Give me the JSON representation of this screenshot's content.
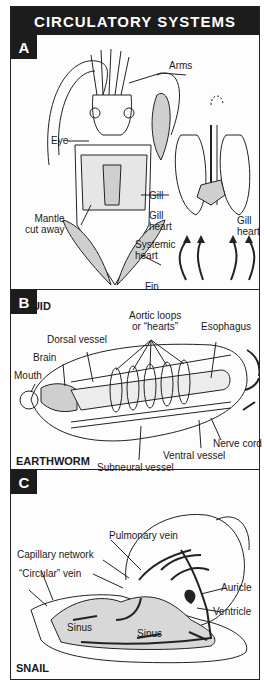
{
  "title": "CIRCULATORY SYSTEMS",
  "panels": [
    {
      "letter": "A",
      "organism": "SQUID",
      "labels": {
        "arms": "Arms",
        "eye": "Eye",
        "gill_left": "Gill",
        "gill_heart_left_1": "Gill",
        "gill_heart_left_2": "heart",
        "gill_heart_right_1": "Gill",
        "gill_heart_right_2": "heart",
        "mantle_1": "Mantle",
        "mantle_2": "cut away",
        "systemic_1": "Systemic",
        "systemic_2": "heart",
        "fin": "Fin"
      }
    },
    {
      "letter": "B",
      "organism": "EARTHWORM",
      "labels": {
        "aortic_1": "Aortic loops",
        "aortic_2": "or “hearts”",
        "esophagus": "Esophagus",
        "dorsal": "Dorsal vessel",
        "brain": "Brain",
        "mouth": "Mouth",
        "nerve": "Nerve cord",
        "ventral": "Ventral vessel",
        "subneural": "Subneural vessel"
      }
    },
    {
      "letter": "C",
      "organism": "SNAIL",
      "labels": {
        "pulmonary": "Pulmonary vein",
        "capillary": "Capillary network",
        "circular": "“Circular” vein",
        "auricle": "Auricle",
        "ventricle": "Ventricle",
        "sinus_1": "Sinus",
        "sinus_2": "Sinus"
      }
    }
  ],
  "colors": {
    "ink": "#1c1c1c",
    "paper": "#fdfdfd",
    "shade": "#cfcfcf"
  }
}
